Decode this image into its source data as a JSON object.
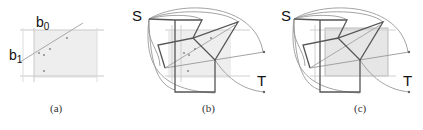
{
  "panels": [
    {
      "id": "a",
      "caption": "(a)",
      "labels": {
        "b0": "b",
        "b0_sub": "0",
        "b1": "b",
        "b1_sub": "1"
      }
    },
    {
      "id": "b",
      "caption": "(b)",
      "labels": {
        "source": "S",
        "target": "T"
      }
    },
    {
      "id": "c",
      "caption": "(c)",
      "labels": {
        "source": "S",
        "target": "T"
      }
    }
  ],
  "colors": {
    "region_fill": "#ebebeb",
    "grid_line": "#c8c8c8",
    "dark_edge": "#555555",
    "light_edge": "#999999",
    "point": "#888888"
  }
}
